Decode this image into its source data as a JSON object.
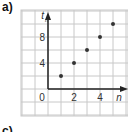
{
  "panel_label": "a)",
  "next_panel_label": "c)",
  "chart_data": {
    "type": "scatter",
    "title": "",
    "xlabel": "n",
    "ylabel": "t_n",
    "x": [
      1,
      2,
      3,
      4,
      5
    ],
    "y": [
      2,
      4,
      6,
      8,
      10
    ],
    "x_ticks": [
      "0",
      "2",
      "4"
    ],
    "y_ticks": [
      "4",
      "8"
    ],
    "xlim": [
      -3,
      5.5
    ],
    "ylim": [
      -3,
      11
    ],
    "grid": true,
    "colors": {
      "grid": "#c8c8c8",
      "axis": "#222222",
      "points": "#333333"
    }
  }
}
